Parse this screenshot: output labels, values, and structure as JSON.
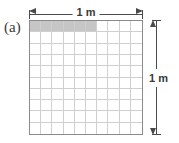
{
  "figure": {
    "panel_label": "(a)",
    "caption_text": "",
    "colors": {
      "shaded_cell": "#c6c6c6",
      "grid_line": "#cfcfcf",
      "border": "#8a8a8a",
      "arrow": "#4a4a4a",
      "background": "#ffffff"
    }
  },
  "dimensions": {
    "top": {
      "label": "1 m",
      "arrow_style": "double-headed",
      "orientation": "horizontal"
    },
    "right": {
      "label": "1 m",
      "arrow_style": "double-headed",
      "orientation": "vertical"
    }
  },
  "chart_data": {
    "type": "heatmap",
    "title": "",
    "subtitle": "",
    "xlabel": "1 m",
    "ylabel": "1 m",
    "rows": 10,
    "cols": 10,
    "grid": true,
    "legend": "",
    "annotations": [
      "(a)"
    ],
    "shaded_cells": [
      {
        "row": 0,
        "col": 0
      },
      {
        "row": 0,
        "col": 1
      },
      {
        "row": 0,
        "col": 2
      },
      {
        "row": 0,
        "col": 3
      },
      {
        "row": 0,
        "col": 4
      },
      {
        "row": 0,
        "col": 5
      }
    ],
    "values": [
      [
        1,
        1,
        1,
        1,
        1,
        1,
        0,
        0,
        0,
        0
      ],
      [
        0,
        0,
        0,
        0,
        0,
        0,
        0,
        0,
        0,
        0
      ],
      [
        0,
        0,
        0,
        0,
        0,
        0,
        0,
        0,
        0,
        0
      ],
      [
        0,
        0,
        0,
        0,
        0,
        0,
        0,
        0,
        0,
        0
      ],
      [
        0,
        0,
        0,
        0,
        0,
        0,
        0,
        0,
        0,
        0
      ],
      [
        0,
        0,
        0,
        0,
        0,
        0,
        0,
        0,
        0,
        0
      ],
      [
        0,
        0,
        0,
        0,
        0,
        0,
        0,
        0,
        0,
        0
      ],
      [
        0,
        0,
        0,
        0,
        0,
        0,
        0,
        0,
        0,
        0
      ],
      [
        0,
        0,
        0,
        0,
        0,
        0,
        0,
        0,
        0,
        0
      ],
      [
        0,
        0,
        0,
        0,
        0,
        0,
        0,
        0,
        0,
        0
      ]
    ],
    "xlim": [
      0,
      1
    ],
    "ylim": [
      0,
      1
    ]
  }
}
